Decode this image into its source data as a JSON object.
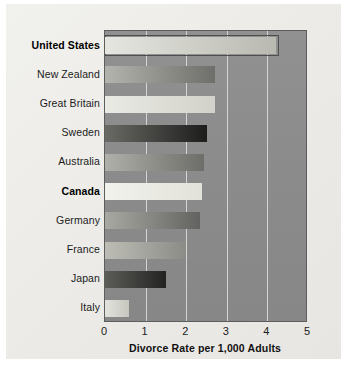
{
  "chart_data": {
    "type": "bar",
    "orientation": "horizontal",
    "title": "",
    "xlabel": "Divorce Rate per 1,000 Adults",
    "ylabel": "",
    "xlim": [
      0,
      5
    ],
    "xticks": [
      "0",
      "1",
      "2",
      "3",
      "4",
      "5"
    ],
    "grid": "vertical",
    "legend": "none",
    "categories": [
      "United States",
      "New Zealand",
      "Great Britain",
      "Sweden",
      "Australia",
      "Canada",
      "Germany",
      "France",
      "Japan",
      "Italy"
    ],
    "values": [
      4.2,
      2.7,
      2.7,
      2.5,
      2.45,
      2.4,
      2.35,
      2.0,
      1.5,
      0.6
    ],
    "highlighted": [
      "United States",
      "Canada"
    ],
    "bars": [
      {
        "label": "United States",
        "value": 4.2,
        "bold": true,
        "fill_left": "#e6e6e0",
        "fill_right": "#b9b9b2",
        "outlined": true
      },
      {
        "label": "New Zealand",
        "value": 2.7,
        "bold": false,
        "fill_left": "#b4b4ae",
        "fill_right": "#6e6e6a",
        "outlined": false
      },
      {
        "label": "Great Britain",
        "value": 2.7,
        "bold": false,
        "fill_left": "#eaeae4",
        "fill_right": "#d2d2cb",
        "outlined": false
      },
      {
        "label": "Sweden",
        "value": 2.5,
        "bold": false,
        "fill_left": "#696965",
        "fill_right": "#1d1d1c",
        "outlined": false
      },
      {
        "label": "Australia",
        "value": 2.45,
        "bold": false,
        "fill_left": "#b0b0aa",
        "fill_right": "#6d6d69",
        "outlined": false
      },
      {
        "label": "Canada",
        "value": 2.4,
        "bold": true,
        "fill_left": "#f2f2ec",
        "fill_right": "#e2e2db",
        "outlined": false
      },
      {
        "label": "Germany",
        "value": 2.35,
        "bold": false,
        "fill_left": "#a9a9a3",
        "fill_right": "#626260",
        "outlined": false
      },
      {
        "label": "France",
        "value": 2.0,
        "bold": false,
        "fill_left": "#bdbdb6",
        "fill_right": "#8c8c87",
        "outlined": false
      },
      {
        "label": "Japan",
        "value": 1.5,
        "bold": false,
        "fill_left": "#5c5c59",
        "fill_right": "#232321",
        "outlined": false
      },
      {
        "label": "Italy",
        "value": 0.6,
        "bold": false,
        "fill_left": "#e3e3dd",
        "fill_right": "#c6c6bf",
        "outlined": false
      }
    ],
    "colors": {
      "plot_background": "#8c8c8c",
      "paper_background": "#eeeeea",
      "gridline": "#e2e2e2",
      "axis_text": "#1b1b1b"
    }
  }
}
